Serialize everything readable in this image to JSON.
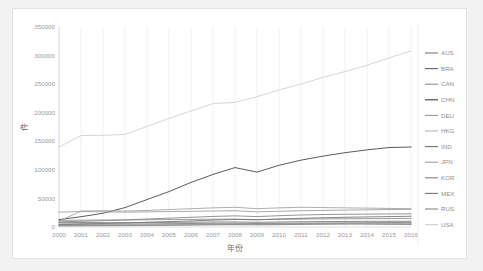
{
  "card": {
    "name": "line-chart-card"
  },
  "chart_data": {
    "type": "line",
    "title": "",
    "xlabel": "年份",
    "ylabel": "件",
    "grid": "vertical",
    "legend_position": "right",
    "xlim": [
      2000,
      2016
    ],
    "ylim": [
      0,
      350000
    ],
    "ytick_values": [
      0,
      50000,
      100000,
      150000,
      200000,
      250000,
      300000,
      350000
    ],
    "ytick_labels": [
      "0",
      "50000",
      "100000",
      "150000",
      "200000",
      "250000",
      "300000",
      "350000"
    ],
    "categories": [
      2000,
      2001,
      2002,
      2003,
      2004,
      2005,
      2006,
      2007,
      2008,
      2009,
      2010,
      2011,
      2012,
      2013,
      2014,
      2015,
      2016
    ],
    "xtick_labels": [
      "2000",
      "2001",
      "2002",
      "2003",
      "2004",
      "2005",
      "2006",
      "2007",
      "2008",
      "2009",
      "2010",
      "2011",
      "2012",
      "2013",
      "2014",
      "2015",
      "2016"
    ],
    "series": [
      {
        "name": "AUS",
        "color": "#7a7a7a",
        "values": [
          4200,
          4600,
          4800,
          5100,
          5400,
          5800,
          6100,
          6400,
          6600,
          6200,
          6500,
          6800,
          7000,
          7200,
          7500,
          7800,
          8000
        ]
      },
      {
        "name": "BRA",
        "color": "#656565",
        "values": [
          2600,
          2900,
          3000,
          3200,
          3500,
          3800,
          4100,
          4500,
          4900,
          4600,
          5200,
          5600,
          6000,
          6200,
          6100,
          5800,
          5600
        ]
      },
      {
        "name": "CAN",
        "color": "#8a8a8a",
        "values": [
          11500,
          12000,
          12200,
          12300,
          12600,
          13000,
          13300,
          13600,
          13800,
          12900,
          13400,
          13900,
          14200,
          14400,
          14600,
          14800,
          15000
        ]
      },
      {
        "name": "CHN",
        "color": "#3d3d3d",
        "values": [
          13000,
          18000,
          24000,
          34000,
          48000,
          62000,
          78000,
          92000,
          104000,
          96000,
          108000,
          117000,
          124000,
          130000,
          135000,
          139000,
          140000
        ]
      },
      {
        "name": "DEU",
        "color": "#9a9a9a",
        "values": [
          26000,
          27000,
          26500,
          26000,
          26500,
          27000,
          27500,
          28000,
          28500,
          26500,
          27500,
          28500,
          29000,
          29500,
          30000,
          30500,
          31000
        ]
      },
      {
        "name": "HKG",
        "color": "#b4b4b4",
        "values": [
          3000,
          3200,
          3300,
          3500,
          3800,
          4000,
          4300,
          4600,
          4800,
          4500,
          5000,
          5300,
          5600,
          5800,
          6000,
          6100,
          6200
        ]
      },
      {
        "name": "IND",
        "color": "#707070",
        "values": [
          5000,
          5600,
          6200,
          7000,
          8200,
          9400,
          10600,
          12000,
          13200,
          12600,
          14000,
          15200,
          16200,
          17000,
          17600,
          18200,
          18800
        ]
      },
      {
        "name": "JPN",
        "color": "#9f9f9f",
        "values": [
          10000,
          28000,
          28500,
          28000,
          29000,
          30500,
          32000,
          33500,
          34500,
          32000,
          33500,
          34500,
          34000,
          33500,
          33000,
          32500,
          32000
        ]
      },
      {
        "name": "KOR",
        "color": "#828282",
        "values": [
          9000,
          10000,
          11000,
          12500,
          14000,
          15500,
          17000,
          18500,
          19500,
          18200,
          19800,
          21000,
          21800,
          22300,
          22600,
          22800,
          23000
        ]
      },
      {
        "name": "MEX",
        "color": "#767676",
        "values": [
          7500,
          7800,
          7600,
          7500,
          7800,
          8100,
          8400,
          8700,
          8900,
          8200,
          8800,
          9200,
          9500,
          9700,
          9900,
          10000,
          10100
        ]
      },
      {
        "name": "RUS",
        "color": "#888888",
        "values": [
          1800,
          2000,
          2200,
          2400,
          2700,
          3000,
          3300,
          3700,
          4000,
          3700,
          4100,
          4500,
          4800,
          5000,
          4900,
          4600,
          4400
        ]
      },
      {
        "name": "USA",
        "color": "#cfcfcf",
        "values": [
          140000,
          160000,
          160500,
          162000,
          176000,
          190000,
          203000,
          216000,
          218000,
          228000,
          240000,
          250000,
          262000,
          272000,
          283000,
          296000,
          308000
        ]
      }
    ]
  }
}
